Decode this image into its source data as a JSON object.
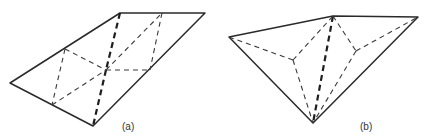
{
  "figure": {
    "panels": [
      {
        "id": "a",
        "label": "(a)",
        "outline": "10,83 120,13 205,13 93,126",
        "bold_dashed": [
          {
            "x1": 120,
            "y1": 13,
            "x2": 106,
            "y2": 70
          },
          {
            "x1": 106,
            "y1": 70,
            "x2": 93,
            "y2": 126
          }
        ],
        "thin_dashed": [
          {
            "x1": 65,
            "y1": 49,
            "x2": 106,
            "y2": 70
          },
          {
            "x1": 106,
            "y1": 70,
            "x2": 150,
            "y2": 70
          },
          {
            "x1": 52,
            "y1": 105,
            "x2": 106,
            "y2": 70
          },
          {
            "x1": 106,
            "y1": 70,
            "x2": 162,
            "y2": 13
          },
          {
            "x1": 65,
            "y1": 49,
            "x2": 52,
            "y2": 105
          },
          {
            "x1": 162,
            "y1": 13,
            "x2": 150,
            "y2": 70
          }
        ]
      },
      {
        "id": "b",
        "label": "(b)",
        "outline": "229,37 333,16 418,17 313,123",
        "bold_dashed": [
          {
            "x1": 333,
            "y1": 16,
            "x2": 313,
            "y2": 123
          }
        ],
        "thin_dashed": [
          {
            "x1": 229,
            "y1": 37,
            "x2": 293,
            "y2": 60
          },
          {
            "x1": 293,
            "y1": 60,
            "x2": 333,
            "y2": 16
          },
          {
            "x1": 293,
            "y1": 60,
            "x2": 313,
            "y2": 123
          },
          {
            "x1": 333,
            "y1": 16,
            "x2": 356,
            "y2": 51
          },
          {
            "x1": 356,
            "y1": 51,
            "x2": 418,
            "y2": 17
          },
          {
            "x1": 356,
            "y1": 51,
            "x2": 313,
            "y2": 123
          }
        ]
      }
    ]
  }
}
